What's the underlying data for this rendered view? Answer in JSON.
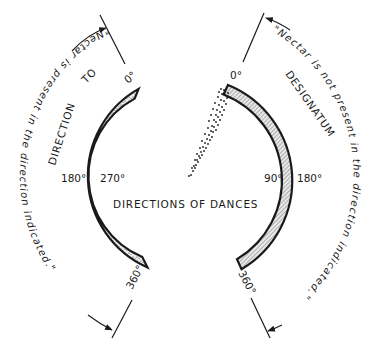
{
  "diagram": {
    "title": "DIRECTIONS OF DANCES",
    "left_panel": {
      "heading": "DIRECTION TO",
      "heading_parts": [
        "DIRECTION",
        "TO"
      ],
      "arc_fill": "stippled",
      "degree_labels": {
        "top": "0°",
        "mid_outer": "180°",
        "mid_inner": "270°",
        "bottom": "360°"
      },
      "caption_top": "\"Nectar is present in the direction indicated.\"",
      "caption_upper_segment": "in the direction indicated.\"",
      "caption_lower_segment": "\"Nectar is present"
    },
    "right_panel": {
      "heading": "DESIGNATUM",
      "arc_fill": "hatched",
      "degree_labels": {
        "top": "0°",
        "mid_inner": "90°",
        "mid_outer": "180°",
        "bottom": "360°"
      },
      "caption_full": "\"Nectar is not present in the direction indicated.\"",
      "caption_upper_segment": "\"Nectar is not present in the",
      "caption_lower_segment": "direction indicated.\""
    },
    "center": {
      "element": "dotted-cone",
      "points_from": "center",
      "points_to": "0°"
    },
    "colors": {
      "ink": "#1a1a1a",
      "background": "#ffffff",
      "arc_fill_left": "#d9d9d9",
      "arc_fill_right": "#cfcfcf"
    }
  }
}
